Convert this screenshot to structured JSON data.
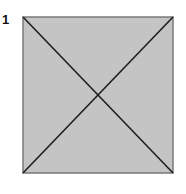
{
  "step": {
    "number": "1"
  },
  "diagram": {
    "shape": "square-with-diagonals",
    "square": {
      "x": 23,
      "y": 17,
      "size": 150
    },
    "fill_color": "#c4c4c4",
    "stroke_color": "#777777",
    "diagonal_color": "#1e1e1e"
  }
}
